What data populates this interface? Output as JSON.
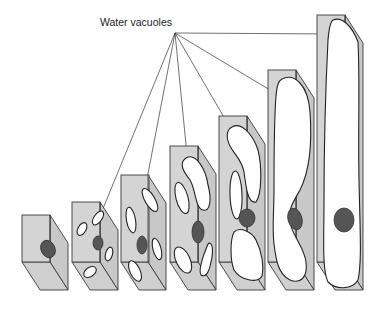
{
  "label": {
    "text": "Water vacuoles",
    "x": 100,
    "y": 23
  },
  "colors": {
    "cell_wall": "#d4d4d4",
    "nucleus": "#555555",
    "vacuole": "#ffffff",
    "outline": "#3a3a3a"
  },
  "convergence_point": [
    175,
    33
  ],
  "cells": [
    {
      "stage": 1,
      "front": [
        22,
        215,
        28,
        47
      ],
      "depth": [
        18,
        28
      ],
      "nucleus": [
        46,
        247,
        7,
        9
      ],
      "vacuole_count": 0
    },
    {
      "stage": 2,
      "front": [
        72,
        202,
        28,
        60
      ],
      "depth": [
        18,
        28
      ],
      "nucleus": [
        98,
        243,
        5,
        7
      ],
      "vacuole_count": 5
    },
    {
      "stage": 3,
      "front": [
        121,
        175,
        28,
        87
      ],
      "depth": [
        18,
        28
      ],
      "nucleus": [
        142,
        244,
        5,
        9
      ],
      "vacuole_count": 5
    },
    {
      "stage": 4,
      "front": [
        170,
        146,
        28,
        116
      ],
      "depth": [
        18,
        28
      ],
      "nucleus": [
        198,
        232,
        6,
        11
      ],
      "vacuole_count": 4
    },
    {
      "stage": 5,
      "front": [
        219,
        116,
        28,
        146
      ],
      "depth": [
        18,
        28
      ],
      "nucleus": [
        247,
        218,
        8,
        9
      ],
      "vacuole_count": 3
    },
    {
      "stage": 6,
      "front": [
        268,
        70,
        28,
        192
      ],
      "depth": [
        18,
        28
      ],
      "nucleus": [
        295,
        219,
        8,
        11
      ],
      "vacuole_count": 1
    },
    {
      "stage": 7,
      "front": [
        317,
        15,
        28,
        247
      ],
      "depth": [
        18,
        28
      ],
      "nucleus": [
        344,
        220,
        10,
        12
      ],
      "vacuole_count": 1
    }
  ],
  "leader_targets": [
    [
      102,
      211
    ],
    [
      146,
      184
    ],
    [
      188,
      165
    ],
    [
      236,
      138
    ],
    [
      285,
      99
    ],
    [
      336,
      34
    ]
  ]
}
